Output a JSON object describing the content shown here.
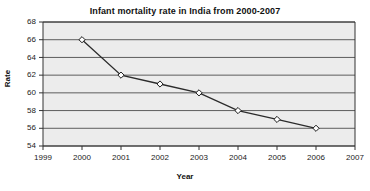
{
  "chart_data": {
    "type": "line",
    "title": "Infant mortality rate in India from 2000-2007",
    "xlabel": "Year",
    "ylabel": "Rate",
    "x": [
      2000,
      2001,
      2002,
      2003,
      2004,
      2005,
      2006
    ],
    "values": [
      66,
      62,
      61,
      60,
      58,
      57,
      56
    ],
    "series": [
      {
        "name": "Infant mortality rate",
        "values": [
          66,
          62,
          61,
          60,
          58,
          57,
          56
        ]
      }
    ],
    "xlim": [
      1999,
      2007
    ],
    "ylim": [
      54,
      68
    ],
    "xticks": [
      1999,
      2000,
      2001,
      2002,
      2003,
      2004,
      2005,
      2006,
      2007
    ],
    "xtick_labels": [
      "1999",
      "2000",
      "2001",
      "2002",
      "2003",
      "2004",
      "2005",
      "2006",
      "2007"
    ],
    "yticks": [
      54,
      56,
      58,
      60,
      62,
      64,
      66,
      68
    ],
    "ytick_labels": [
      "54",
      "56",
      "58",
      "60",
      "62",
      "64",
      "66",
      "68"
    ],
    "grid": "horizontal",
    "legend": "none",
    "marker": "open-diamond",
    "colors": {
      "line": "#2b2b2b",
      "marker_fill": "#ffffff",
      "marker_stroke": "#1a1a1a",
      "plot_background": "#ececec",
      "gridline": "#4d4d4d",
      "axis": "#333333",
      "title_text": "#111111",
      "tick_text": "#222222"
    }
  }
}
